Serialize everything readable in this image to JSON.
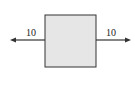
{
  "diagram": {
    "type": "force-diagram",
    "box": {
      "fill": "#e6e6e6",
      "stroke": "#333333"
    },
    "forces": [
      {
        "direction": "left",
        "label": "10"
      },
      {
        "direction": "right",
        "label": "10"
      }
    ]
  }
}
